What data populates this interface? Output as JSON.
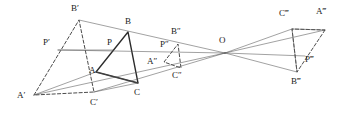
{
  "figure": {
    "colors": {
      "ink": "#2b2b2b",
      "ink_light": "#555555",
      "background": "#ffffff"
    },
    "centre_label": "O",
    "labels": [
      {
        "id": "A",
        "text": "A",
        "x": 89,
        "y": 66
      },
      {
        "id": "B",
        "text": "B",
        "x": 125,
        "y": 17
      },
      {
        "id": "C",
        "text": "C",
        "x": 134,
        "y": 88
      },
      {
        "id": "P",
        "text": "P",
        "x": 107,
        "y": 38
      },
      {
        "id": "Ap",
        "text": "A′",
        "x": 17,
        "y": 91
      },
      {
        "id": "Bp",
        "text": "B′",
        "x": 71,
        "y": 4
      },
      {
        "id": "Cp",
        "text": "C′",
        "x": 90,
        "y": 98
      },
      {
        "id": "Pp",
        "text": "P′",
        "x": 43,
        "y": 38
      },
      {
        "id": "App",
        "text": "A″",
        "x": 147,
        "y": 57
      },
      {
        "id": "Bpp",
        "text": "B″",
        "x": 171,
        "y": 27
      },
      {
        "id": "Cpp",
        "text": "C″",
        "x": 172,
        "y": 71
      },
      {
        "id": "Ppp",
        "text": "P″",
        "x": 160,
        "y": 40
      },
      {
        "id": "O",
        "text": "O",
        "x": 219,
        "y": 36
      },
      {
        "id": "Appp",
        "text": "A‴",
        "x": 316,
        "y": 7
      },
      {
        "id": "Bppp",
        "text": "B‴",
        "x": 291,
        "y": 77
      },
      {
        "id": "Cppp",
        "text": "C‴",
        "x": 279,
        "y": 9
      },
      {
        "id": "Pppp",
        "text": "P‴",
        "x": 305,
        "y": 55
      }
    ],
    "points": {
      "A": {
        "x": 96,
        "y": 72
      },
      "B": {
        "x": 128,
        "y": 32
      },
      "C": {
        "x": 138,
        "y": 83
      },
      "P": {
        "x": 113,
        "y": 50
      },
      "Ap": {
        "x": 34,
        "y": 95
      },
      "Bp": {
        "x": 79,
        "y": 20
      },
      "Cp": {
        "x": 94,
        "y": 92
      },
      "Pp": {
        "x": 58,
        "y": 50
      },
      "App": {
        "x": 164,
        "y": 62
      },
      "Bpp": {
        "x": 178,
        "y": 44
      },
      "Cpp": {
        "x": 181,
        "y": 68
      },
      "Ppp": {
        "x": 171,
        "y": 51
      },
      "O": {
        "x": 225,
        "y": 53
      },
      "Appp": {
        "x": 325,
        "y": 30
      },
      "Bppp": {
        "x": 297,
        "y": 72
      },
      "Cppp": {
        "x": 292,
        "y": 29
      },
      "Pppp": {
        "x": 305,
        "y": 56
      }
    },
    "shapes": [
      {
        "name": "triangle-abc",
        "style": "solid-bold",
        "path": "M96,72 L128,32 L138,83 Z"
      },
      {
        "name": "triangle-a1b1c1",
        "style": "dashed",
        "path": "M34,95 L79,20 L94,92 Z"
      },
      {
        "name": "triangle-a2b2c2",
        "style": "dashed",
        "path": "M164,62 L178,44 L181,68 Z"
      },
      {
        "name": "triangle-a3b3c3",
        "style": "dashed",
        "path": "M325,30 L297,72 L292,29 Z"
      },
      {
        "name": "ray-o-to-b1",
        "style": "solid-thin",
        "path": "M225,53 L79,20"
      },
      {
        "name": "ray-o-to-a1",
        "style": "solid-thin",
        "path": "M225,53 L34,95"
      },
      {
        "name": "ray-o-to-c1",
        "style": "solid-thin",
        "path": "M225,53 L94,92"
      },
      {
        "name": "ray-o-to-p1",
        "style": "solid-thin",
        "path": "M225,53 L58,50"
      },
      {
        "name": "ray-o-to-a3",
        "style": "solid-thin",
        "path": "M225,53 L325,30"
      },
      {
        "name": "ray-o-to-b3",
        "style": "solid-thin",
        "path": "M225,53 L297,72"
      },
      {
        "name": "ray-o-to-c3",
        "style": "solid-thin",
        "path": "M225,53 L292,29"
      },
      {
        "name": "ray-o-to-p3",
        "style": "solid-thin",
        "path": "M225,53 L305,56"
      },
      {
        "name": "segment-p1-p",
        "style": "solid-thin",
        "path": "M58,50 L113,50"
      },
      {
        "name": "segment-a1-a",
        "style": "solid-thin",
        "path": "M34,95 L96,72"
      },
      {
        "name": "segment-c1-c",
        "style": "solid-thin",
        "path": "M94,92 L138,83"
      },
      {
        "name": "segment-a-c",
        "style": "solid-thin",
        "path": "M96,72 L138,83"
      },
      {
        "name": "edge-c3-a3",
        "style": "solid-thin",
        "path": "M292,29 L325,30"
      },
      {
        "name": "edge-c3-b3",
        "style": "solid-thin",
        "path": "M292,29 L297,72"
      }
    ]
  }
}
